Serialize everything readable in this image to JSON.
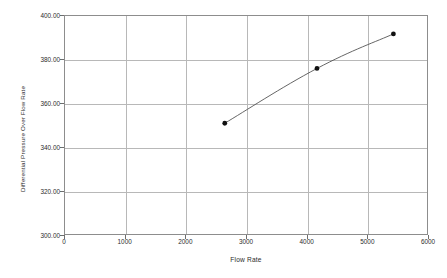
{
  "chart_data": {
    "type": "line",
    "title": "",
    "xlabel": "Flow Rate",
    "ylabel": "Differential Pressure Over Flow Rate",
    "xlim": [
      0,
      6000
    ],
    "ylim": [
      300.0,
      400.0
    ],
    "grid": true,
    "legend": "none",
    "marker": "filled-circle",
    "x": [
      2650,
      4170,
      5430
    ],
    "y": [
      350.8,
      375.7,
      391.4
    ],
    "series": [
      {
        "name": "Differential Pressure Over Flow Rate",
        "x": [
          2650,
          4170,
          5430
        ],
        "values": [
          350.8,
          375.7,
          391.4
        ]
      }
    ],
    "x_tick_labels": [
      "0",
      "1000",
      "2000",
      "3000",
      "4000",
      "5000",
      "6000"
    ],
    "x_tick_values": [
      0,
      1000,
      2000,
      3000,
      4000,
      5000,
      6000
    ],
    "y_tick_labels": [
      "300.00",
      "320.00",
      "340.00",
      "360.00",
      "380.00",
      "400.00"
    ],
    "y_tick_values": [
      300,
      320,
      340,
      360,
      380,
      400
    ],
    "colors": {
      "line": "#555555",
      "marker": "#111111",
      "grid": "#b8b8b8",
      "frame": "#8d8d8d",
      "text": "#2b2b2b",
      "background": "#ffffff"
    }
  }
}
